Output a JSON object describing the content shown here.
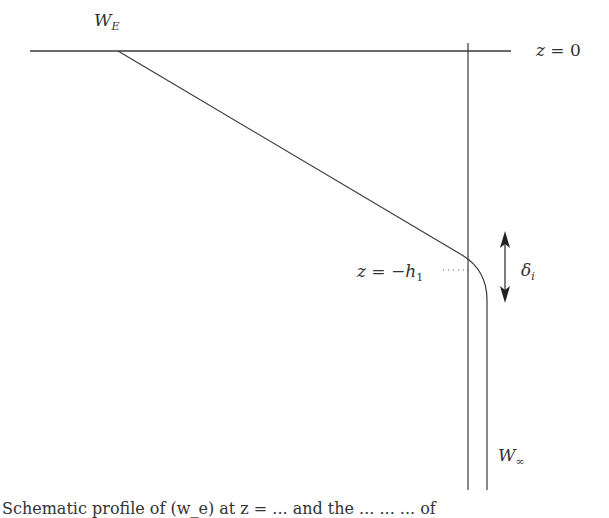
{
  "diagram": {
    "labels": {
      "w_e": {
        "main": "W",
        "sub": "E"
      },
      "z0": {
        "lhs": "z",
        "eq": " = ",
        "rhs": "0"
      },
      "z_h1": {
        "lhs": "z",
        "eq": " = −",
        "var": "h",
        "sub": "1"
      },
      "delta_i": {
        "main": "δ",
        "sub": "i"
      },
      "w_inf": {
        "main": "W",
        "sub": "∞"
      }
    },
    "caption": "Schematic profile of (w_e) at z = ... and the ... ... ... of"
  },
  "colors": {
    "line": "#3a3a3a",
    "background": "#ffffff"
  }
}
